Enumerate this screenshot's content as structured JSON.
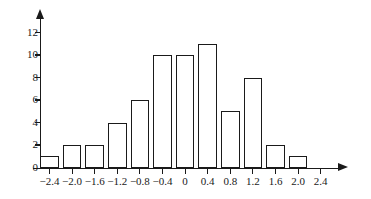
{
  "chart_data": {
    "type": "bar",
    "title": "",
    "subtitle": "",
    "xlabel": "",
    "ylabel": "",
    "categories": [
      "-2.4",
      "-2.0",
      "-1.6",
      "-1.2",
      "-0.8",
      "-0.4",
      "0",
      "0.4",
      "0.8",
      "1.2",
      "1.6",
      "2.0",
      "2.4"
    ],
    "values": [
      1,
      2,
      2,
      4,
      6,
      10,
      10,
      11,
      5,
      8,
      2,
      1,
      0
    ],
    "bin_width": 0.4,
    "x_tick_labels": [
      "−2.4",
      "−2.0",
      "−1.6",
      "−1.2",
      "−0.8",
      "−0.4",
      "0",
      "0.4",
      "0.8",
      "1.2",
      "1.6",
      "2.0",
      "2.4"
    ],
    "y_tick_labels": [
      "0",
      "2",
      "4",
      "6",
      "8",
      "10",
      "12"
    ],
    "y_tick_values": [
      0,
      2,
      4,
      6,
      8,
      10,
      12
    ],
    "xlim": [
      -2.6,
      2.6
    ],
    "ylim": [
      0,
      12
    ],
    "grid": false,
    "legend": null,
    "legend_position": "none",
    "annotations": [],
    "bar_fill_color": "#ffffff",
    "bar_edge_color": "#1a1a1a",
    "axis_color": "#1a1a1a",
    "x_axis_has_arrow": true,
    "y_axis_has_arrow": true
  }
}
